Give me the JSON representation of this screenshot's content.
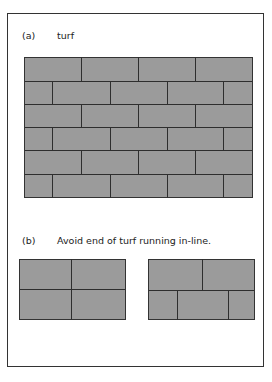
{
  "figure": {
    "part_a": {
      "marker": "(a)",
      "title": "turf"
    },
    "part_b": {
      "marker": "(b)",
      "caption": "Avoid end of turf running in-line."
    },
    "colors": {
      "turf_fill": "#9b9b9b",
      "joint_line": "#2e2e2e",
      "frame": "#333333",
      "background": "#ffffff"
    },
    "main_grid": {
      "x": 24,
      "y": 57,
      "width": 229,
      "height": 141,
      "row_boundaries_y": [
        24,
        47,
        70,
        93,
        117
      ],
      "rows": [
        {
          "top": 0,
          "height": 24,
          "joints_x": [
            57,
            114,
            171
          ]
        },
        {
          "top": 24,
          "height": 23,
          "joints_x": [
            28,
            86,
            143,
            199
          ]
        },
        {
          "top": 47,
          "height": 23,
          "joints_x": [
            57,
            114,
            171
          ]
        },
        {
          "top": 70,
          "height": 23,
          "joints_x": [
            28,
            86,
            143,
            199
          ]
        },
        {
          "top": 93,
          "height": 24,
          "joints_x": [
            57,
            114,
            171
          ]
        },
        {
          "top": 117,
          "height": 24,
          "joints_x": [
            28,
            86,
            143,
            199
          ]
        }
      ]
    },
    "incorrect_example": {
      "x": 19,
      "y": 259,
      "width": 107,
      "height": 61,
      "row_boundaries_y": [
        30
      ],
      "rows": [
        {
          "top": 0,
          "height": 30,
          "joints_x": [
            52
          ]
        },
        {
          "top": 30,
          "height": 31,
          "joints_x": [
            52
          ]
        }
      ]
    },
    "correct_example": {
      "x": 148,
      "y": 259,
      "width": 107,
      "height": 61,
      "row_boundaries_y": [
        31
      ],
      "rows": [
        {
          "top": 0,
          "height": 31,
          "joints_x": [
            54
          ]
        },
        {
          "top": 31,
          "height": 30,
          "joints_x": [
            29,
            80
          ]
        }
      ]
    }
  }
}
